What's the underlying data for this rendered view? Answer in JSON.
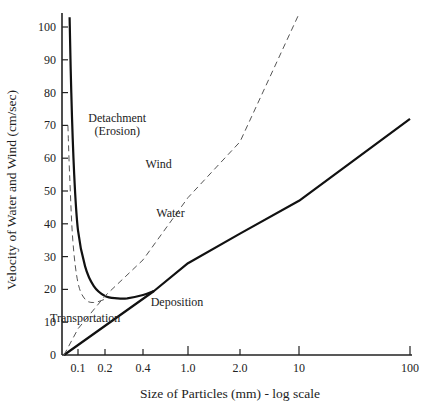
{
  "chart_data": {
    "type": "line",
    "title": "",
    "xlabel": "Size of Particles  (mm) - log scale",
    "ylabel": "Velocity of Water and Wind  (cm/sec)",
    "xscale": "log",
    "x_ticks": [
      0.1,
      0.2,
      0.4,
      1.0,
      2.0,
      10,
      100
    ],
    "x_tick_labels": [
      "0.1",
      "0.2",
      "0.4",
      "1.0",
      "2.0",
      "10",
      "100"
    ],
    "y_ticks": [
      0,
      10,
      20,
      30,
      40,
      50,
      60,
      70,
      80,
      90,
      100
    ],
    "y_tick_labels": [
      "0",
      "10",
      "20",
      "30",
      "40",
      "50",
      "60",
      "70",
      "80",
      "90",
      "100"
    ],
    "ylim": [
      0,
      105
    ],
    "grid": false,
    "series": [
      {
        "name": "Water (detachment curve)",
        "style": "solid-thick",
        "x": [
          0.07,
          0.075,
          0.085,
          0.1,
          0.12,
          0.15,
          0.2,
          0.25,
          0.3,
          0.4,
          0.5
        ],
        "y": [
          103,
          80,
          55,
          38,
          27,
          21,
          18,
          17.3,
          17.3,
          18.3,
          19.5
        ]
      },
      {
        "name": "Water",
        "style": "solid-thick",
        "x": [
          0.055,
          0.5,
          1.0,
          2.0,
          10,
          100
        ],
        "y": [
          0,
          19.5,
          28,
          37,
          47,
          72
        ]
      },
      {
        "name": "Wind (detachment curve)",
        "style": "dashed",
        "x": [
          0.065,
          0.07,
          0.08,
          0.1,
          0.12,
          0.15,
          0.2
        ],
        "y": [
          70,
          55,
          35,
          22,
          17,
          16,
          17
        ]
      },
      {
        "name": "Wind",
        "style": "dashed",
        "x": [
          0.055,
          0.1,
          0.2,
          0.4,
          1.0,
          2.0,
          10
        ],
        "y": [
          0,
          8,
          18,
          29,
          48,
          65,
          104
        ]
      }
    ],
    "annotations": [
      {
        "text": "Detachment",
        "x": 0.25,
        "y": 71
      },
      {
        "text": "(Erosion)",
        "x": 0.25,
        "y": 67
      },
      {
        "text": "Wind",
        "x": 0.55,
        "y": 57
      },
      {
        "text": "Water",
        "x": 0.7,
        "y": 42
      },
      {
        "text": "Transportation",
        "x": 0.12,
        "y": 10
      },
      {
        "text": "Deposition",
        "x": 0.8,
        "y": 15
      }
    ]
  }
}
